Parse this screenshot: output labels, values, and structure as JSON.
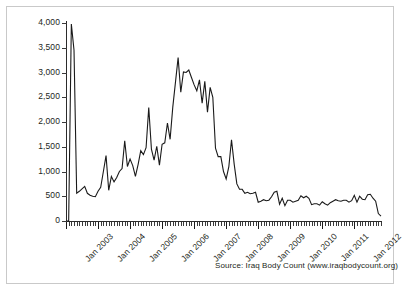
{
  "source_note": "Source: Iraq Body Count (www.iraqbodycount.org)",
  "chart_data": {
    "type": "line",
    "title": "",
    "subtitle": "",
    "xlabel": "",
    "ylabel": "",
    "grid": false,
    "legend": "none",
    "line_color": "#1a1a1a",
    "axis_color": "#2b2b2b",
    "text_color": "#231f20",
    "frame_color": "#c9c9c9",
    "background": "#ffffff",
    "ylim": [
      0,
      4000
    ],
    "ytick_values": [
      0,
      500,
      1000,
      1500,
      2000,
      2500,
      3000,
      3500,
      4000
    ],
    "ytick_labels": [
      "0",
      "500",
      "1,000",
      "1,500",
      "2,000",
      "2,500",
      "3,000",
      "3,500",
      "4,000"
    ],
    "xlim_labels": [
      "Jan 2003",
      "Jan 2004",
      "Jan 2005",
      "Jan 2006",
      "Jan 2007",
      "Jan 2008",
      "Jan 2009",
      "Jan 2010",
      "Jan 2011",
      "Jan 2012"
    ],
    "xtick_major_indices": [
      0,
      12,
      24,
      36,
      48,
      60,
      72,
      84,
      96,
      108
    ],
    "x_start": "Jan 2003",
    "x_end": "Nov 2012",
    "x_tick_interval": "month",
    "x": [
      "Jan 2003",
      "Feb 2003",
      "Mar 2003",
      "Apr 2003",
      "May 2003",
      "Jun 2003",
      "Jul 2003",
      "Aug 2003",
      "Sep 2003",
      "Oct 2003",
      "Nov 2003",
      "Dec 2003",
      "Jan 2004",
      "Feb 2004",
      "Mar 2004",
      "Apr 2004",
      "May 2004",
      "Jun 2004",
      "Jul 2004",
      "Aug 2004",
      "Sep 2004",
      "Oct 2004",
      "Nov 2004",
      "Dec 2004",
      "Jan 2005",
      "Feb 2005",
      "Mar 2005",
      "Apr 2005",
      "May 2005",
      "Jun 2005",
      "Jul 2005",
      "Aug 2005",
      "Sep 2005",
      "Oct 2005",
      "Nov 2005",
      "Dec 2005",
      "Jan 2006",
      "Feb 2006",
      "Mar 2006",
      "Apr 2006",
      "May 2006",
      "Jun 2006",
      "Jul 2006",
      "Aug 2006",
      "Sep 2006",
      "Oct 2006",
      "Nov 2006",
      "Dec 2006",
      "Jan 2007",
      "Feb 2007",
      "Mar 2007",
      "Apr 2007",
      "May 2007",
      "Jun 2007",
      "Jul 2007",
      "Aug 2007",
      "Sep 2007",
      "Oct 2007",
      "Nov 2007",
      "Dec 2007",
      "Jan 2008",
      "Feb 2008",
      "Mar 2008",
      "Apr 2008",
      "May 2008",
      "Jun 2008",
      "Jul 2008",
      "Aug 2008",
      "Sep 2008",
      "Oct 2008",
      "Nov 2008",
      "Dec 2008",
      "Jan 2009",
      "Feb 2009",
      "Mar 2009",
      "Apr 2009",
      "May 2009",
      "Jun 2009",
      "Jul 2009",
      "Aug 2009",
      "Sep 2009",
      "Oct 2009",
      "Nov 2009",
      "Dec 2009",
      "Jan 2010",
      "Feb 2010",
      "Mar 2010",
      "Apr 2010",
      "May 2010",
      "Jun 2010",
      "Jul 2010",
      "Aug 2010",
      "Sep 2010",
      "Oct 2010",
      "Nov 2010",
      "Dec 2010",
      "Jan 2011",
      "Feb 2011",
      "Mar 2011",
      "Apr 2011",
      "May 2011",
      "Jun 2011",
      "Jul 2011",
      "Aug 2011",
      "Sep 2011",
      "Oct 2011",
      "Nov 2011",
      "Dec 2011",
      "Jan 2012",
      "Feb 2012",
      "Mar 2012",
      "Apr 2012",
      "May 2012",
      "Jun 2012",
      "Jul 2012",
      "Aug 2012",
      "Sep 2012",
      "Oct 2012",
      "Nov 2012"
    ],
    "values": [
      0,
      0,
      3980,
      3450,
      560,
      600,
      650,
      700,
      560,
      520,
      500,
      490,
      600,
      680,
      1000,
      1320,
      620,
      900,
      790,
      880,
      1000,
      1060,
      1620,
      1100,
      1250,
      1120,
      900,
      1140,
      1420,
      1340,
      1480,
      2290,
      1450,
      1230,
      1510,
      1130,
      1550,
      1580,
      1980,
      1650,
      2300,
      2800,
      3300,
      2600,
      3010,
      3000,
      3050,
      2900,
      2750,
      2630,
      2850,
      2380,
      2820,
      2200,
      2700,
      2500,
      1470,
      1300,
      1300,
      1000,
      850,
      1100,
      1640,
      1150,
      750,
      640,
      640,
      560,
      580,
      550,
      560,
      580,
      380,
      400,
      430,
      410,
      420,
      490,
      580,
      600,
      340,
      460,
      310,
      420,
      420,
      380,
      400,
      420,
      510,
      470,
      500,
      460,
      330,
      350,
      350,
      320,
      390,
      350,
      320,
      370,
      400,
      430,
      410,
      400,
      420,
      420,
      380,
      410,
      520,
      380,
      500,
      440,
      430,
      530,
      540,
      460,
      400,
      150,
      100
    ]
  }
}
